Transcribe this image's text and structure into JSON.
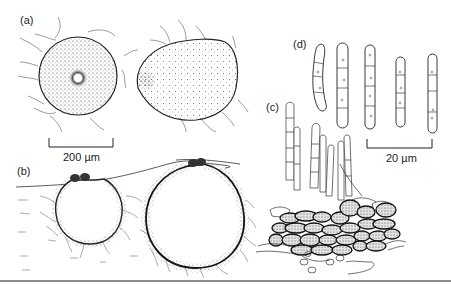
{
  "figure": {
    "panels": [
      {
        "id": "a",
        "label": "(a)",
        "description": "Two ascomata, surface view, stippled, with radiating hyphae"
      },
      {
        "id": "b",
        "label": "(b)",
        "description": "Two ascomata in vertical section, immersed in substrate"
      },
      {
        "id": "c",
        "label": "(c)",
        "description": "Stromatic tissue with erect conidiophores/hyphae"
      },
      {
        "id": "d",
        "label": "(d)",
        "description": "Five septate ascospores"
      }
    ],
    "scale_bars": [
      {
        "id": "scale-200",
        "text": "200 µm",
        "applies_to": "a, b"
      },
      {
        "id": "scale-20",
        "text": "20 µm",
        "applies_to": "c, d"
      }
    ],
    "colors": {
      "ink": "#222222",
      "hairline": "#555555",
      "fill_stipple": "#dcdcdc",
      "rule": "#8a8a8a"
    }
  }
}
